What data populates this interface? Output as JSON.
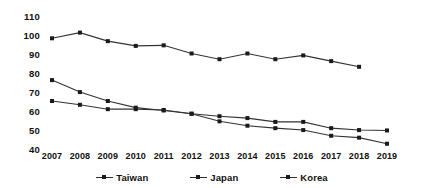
{
  "chart_data": {
    "type": "line",
    "title": "",
    "subtitle": "",
    "xlabel": "",
    "ylabel": "",
    "categories": [
      "2007",
      "2008",
      "2009",
      "2010",
      "2011",
      "2012",
      "2013",
      "2014",
      "2015",
      "2016",
      "2017",
      "2018",
      "2019"
    ],
    "x": [
      2007,
      2008,
      2009,
      2010,
      2011,
      2012,
      2013,
      2014,
      2015,
      2016,
      2017,
      2018,
      2019
    ],
    "series": [
      {
        "name": "Taiwan",
        "color": "#333333",
        "values": [
          98,
          101,
          96.5,
          94,
          94.3,
          90,
          87,
          90,
          87,
          89,
          86,
          83,
          null
        ]
      },
      {
        "name": "Japan",
        "color": "#333333",
        "values": [
          76,
          69.7,
          65,
          61.5,
          60,
          58.3,
          57,
          56,
          54,
          54,
          50.7,
          49.7,
          49.5
        ]
      },
      {
        "name": "Korea",
        "color": "#333333",
        "values": [
          65,
          63,
          60.7,
          60.7,
          60.3,
          58.3,
          54.3,
          52,
          50.7,
          49.7,
          46.7,
          45.7,
          42.5
        ]
      }
    ],
    "ylim": [
      40,
      110
    ],
    "yticks": [
      40,
      50,
      60,
      70,
      80,
      90,
      100,
      110
    ],
    "ytick_labels": [
      "40",
      "50",
      "60",
      "70",
      "80",
      "90",
      "100",
      "110"
    ],
    "grid": false,
    "legend_position": "bottom",
    "legend": [
      "Taiwan",
      "Japan",
      "Korea"
    ],
    "marker": "square",
    "annotations": []
  }
}
